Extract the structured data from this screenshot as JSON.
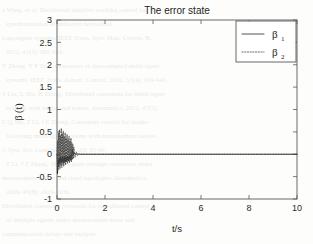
{
  "chart_data": {
    "type": "line",
    "title": "The error state",
    "xlabel": "t/s",
    "ylabel": "β (t)",
    "xlim": [
      0,
      10
    ],
    "ylim": [
      -1,
      3
    ],
    "grid": false,
    "legend_position": "upper right",
    "xticks": [
      "0",
      "2",
      "4",
      "6",
      "8",
      "10"
    ],
    "xtick_values": [
      0,
      2,
      4,
      6,
      8,
      10
    ],
    "yticks": [
      "-1",
      "-0.5",
      "0",
      "0.5",
      "1",
      "1.5",
      "2",
      "2.5",
      "3"
    ],
    "ytick_values": [
      -1,
      -0.5,
      0,
      0.5,
      1,
      1.5,
      2,
      2.5,
      3
    ],
    "series": [
      {
        "name": "β",
        "subscript": "1",
        "style": "solid",
        "color": "#1a1a1a",
        "x": [
          0,
          0.02,
          0.04,
          0.06,
          0.08,
          0.1,
          0.12,
          0.14,
          0.16,
          0.18,
          0.2,
          0.22,
          0.24,
          0.26,
          0.28,
          0.3,
          0.32,
          0.34,
          0.36,
          0.38,
          0.4,
          0.42,
          0.44,
          0.46,
          0.48,
          0.5,
          0.52,
          0.54,
          0.56,
          0.58,
          0.6,
          0.62,
          0.64,
          0.66,
          0.68,
          0.7,
          0.75,
          0.8,
          0.85,
          0.9,
          1.0,
          1.2,
          1.5,
          2.0,
          2.5,
          3.0,
          4.0,
          5.0,
          6.0,
          7.0,
          8.0,
          9.0,
          10.0
        ],
        "y": [
          0.0,
          -0.44,
          -0.3,
          -0.12,
          -0.22,
          -0.08,
          -0.18,
          -0.05,
          -0.14,
          -0.2,
          -0.09,
          -0.16,
          -0.06,
          -0.13,
          -0.19,
          -0.07,
          -0.15,
          -0.05,
          -0.12,
          -0.17,
          -0.06,
          -0.13,
          -0.04,
          -0.11,
          -0.15,
          -0.05,
          -0.1,
          -0.03,
          -0.09,
          -0.13,
          -0.04,
          0.02,
          0.1,
          0.05,
          -0.02,
          0.03,
          0.01,
          0.0,
          0.01,
          0.0,
          0.0,
          0.0,
          0.0,
          0.0,
          0.0,
          0.0,
          0.0,
          0.0,
          0.0,
          0.0,
          0.0,
          0.0,
          0.0
        ]
      },
      {
        "name": "β",
        "subscript": "2",
        "style": "dotted",
        "color": "#3a3a3a",
        "x": [
          0,
          0.02,
          0.04,
          0.06,
          0.08,
          0.1,
          0.12,
          0.14,
          0.16,
          0.18,
          0.2,
          0.22,
          0.24,
          0.26,
          0.28,
          0.3,
          0.32,
          0.34,
          0.36,
          0.38,
          0.4,
          0.42,
          0.44,
          0.46,
          0.48,
          0.5,
          0.52,
          0.54,
          0.56,
          0.58,
          0.6,
          0.62,
          0.64,
          0.66,
          0.68,
          0.7,
          0.75,
          0.8,
          0.85,
          0.9,
          1.0,
          1.2,
          1.5,
          2.0,
          2.5,
          3.0,
          4.0,
          5.0,
          6.0,
          7.0,
          8.0,
          9.0,
          10.0
        ],
        "y": [
          0.0,
          0.3,
          -0.35,
          0.48,
          -0.28,
          0.55,
          -0.33,
          0.42,
          -0.25,
          0.58,
          -0.3,
          0.46,
          -0.22,
          0.52,
          -0.27,
          0.4,
          -0.2,
          0.48,
          -0.24,
          0.36,
          -0.18,
          0.44,
          -0.21,
          0.33,
          -0.16,
          0.4,
          -0.19,
          0.3,
          -0.14,
          0.36,
          -0.17,
          0.26,
          -0.12,
          0.22,
          -0.1,
          0.16,
          -0.07,
          0.05,
          -0.03,
          0.01,
          0.0,
          0.0,
          0.0,
          0.0,
          0.0,
          0.0,
          0.0,
          0.0,
          0.0,
          0.0,
          0.0,
          0.0,
          0.0
        ]
      }
    ]
  },
  "legend": {
    "entries": [
      {
        "label": "β",
        "sub": "1"
      },
      {
        "label": "β",
        "sub": "2"
      }
    ]
  },
  "background_text": {
    "lines": [
      "a Wang, et al. Distributed adaptive tracking control for",
      "synchronization of unknown networked",
      "Lagrangian systems. IEEE Trans. Syst. Man, Cybern. B,",
      "2011, 41(3): 805-816.",
      "Y Zhang, Y P Tian. Consensus of data-sampled multi-agent",
      "systems. IEEE Trans. Autom. Control, 2010, 55(4): 939-943.",
      "S Liu, L Xie, H Zhang. Distributed consensus for multi-agent",
      "systems with delays and noises. Automatica, 2011, 47(5).",
      "C Q Ma, T Li, J F Zhang. Consensus control for leader-",
      "following multi-agent systems with measurement noises.",
      "J. Syst. Sci. Complex, 2010, 23: 35-49.",
      "T Li, J F Zhang. Mean square average-consensus under",
      "measurement noises and fixed topologies. Automatica,",
      "2009, 45(8): 1929-1936.",
      "Distributed consensus protocols for coordinated control",
      "of multiple agents under measurement noise and",
      "communication delays and analysis."
    ]
  }
}
